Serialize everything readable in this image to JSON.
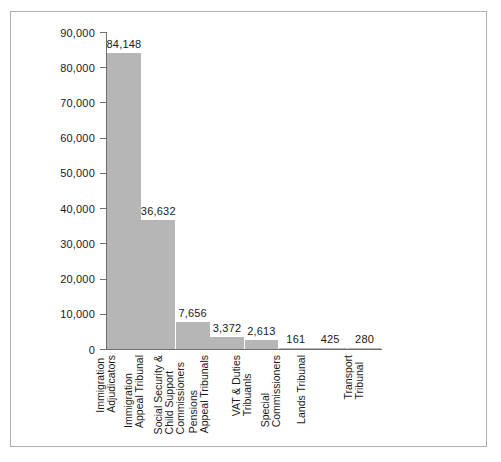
{
  "chart_data": {
    "type": "bar",
    "title": "",
    "subtitle": "",
    "xlabel": "",
    "ylabel": "",
    "ylim": [
      0,
      90000
    ],
    "grid": false,
    "legend": false,
    "orientation": "vertical",
    "bar_color": "#b6b6b6",
    "axis_color": "#6f6f6f",
    "frame_color": "#aeaeae",
    "background_color": "#ffffff",
    "value_labels_shown": true,
    "y_ticks": [
      "0",
      "10,000",
      "20,000",
      "30,000",
      "40,000",
      "50,000",
      "60,000",
      "70,000",
      "80,000",
      "90,000"
    ],
    "y_tick_values": [
      0,
      10000,
      20000,
      30000,
      40000,
      50000,
      60000,
      70000,
      80000,
      90000
    ],
    "categories": [
      "Immigration Adjudicators",
      "Immigration Appeal Tribunal",
      "Social Security & Child Support Commissioners",
      "Pensions Appeal Tribunals",
      "VAT & Duties Tribuanls",
      "Special Commissioners",
      "Lands Tribunal",
      "Transport Tribunal"
    ],
    "category_label_lines": [
      [
        "Immigration",
        "Adjudicators"
      ],
      [
        "Immigration",
        "Appeal Tribunal"
      ],
      [
        "Social Security &",
        "Child Support",
        "Commissioners"
      ],
      [
        "Pensions",
        "Appeal Tribunals"
      ],
      [
        "VAT & Duties",
        "Tribuanls"
      ],
      [
        "Special",
        "Commissioners"
      ],
      [
        "Lands Tribunal"
      ],
      [
        "Transport",
        "Tribunal"
      ]
    ],
    "values": [
      84148,
      36632,
      7656,
      3372,
      2613,
      161,
      425,
      280
    ],
    "value_labels": [
      "84,148",
      "36,632",
      "7,656",
      "3,372",
      "2,613",
      "161",
      "425",
      "280"
    ]
  }
}
